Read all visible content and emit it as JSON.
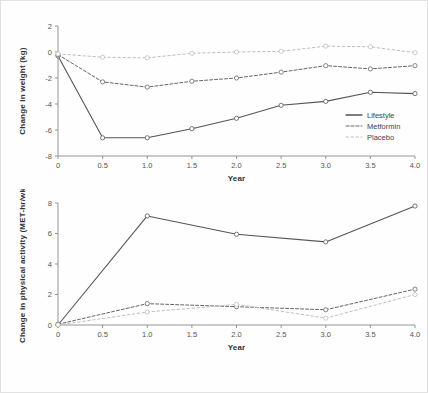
{
  "figure": {
    "background_color": "#fefefe",
    "border_color": "#e2e2e2"
  },
  "series_style": {
    "lifestyle_color": "#555555",
    "metformin_color": "#666666",
    "placebo_color": "#bfbfbf",
    "axis_color": "#8a8a8a",
    "marker_fill": "#ffffff"
  },
  "legend": {
    "position": "inside-bottom-right",
    "entries": [
      {
        "label": "Lifestyle",
        "style": "solid",
        "color": "#555555"
      },
      {
        "label": "Metformin",
        "style": "dashed",
        "color": "#666666"
      },
      {
        "label": "Placebo",
        "style": "dotted",
        "color": "#bfbfbf"
      }
    ]
  },
  "chart_data": [
    {
      "type": "line",
      "id": "weight-change",
      "title": "",
      "xlabel": "Year",
      "ylabel": "Change in weight (kg)",
      "xlim": [
        0,
        4
      ],
      "ylim": [
        -8,
        2
      ],
      "xticks": [
        "0",
        "0.5",
        "1.0",
        "1.5",
        "2.0",
        "2.5",
        "3.0",
        "3.5",
        "4.0"
      ],
      "yticks": [
        "2",
        "0",
        "-2",
        "-4",
        "-6",
        "-8"
      ],
      "grid": false,
      "legend_position": "bottom-right-inside",
      "x": [
        0,
        0.5,
        1.0,
        1.5,
        2.0,
        2.5,
        3.0,
        3.5,
        4.0
      ],
      "series": [
        {
          "name": "Lifestyle",
          "values": [
            -0.3,
            -6.6,
            -6.6,
            -5.9,
            -5.1,
            -4.1,
            -3.8,
            -3.1,
            -3.2
          ]
        },
        {
          "name": "Metformin",
          "values": [
            -0.2,
            -2.3,
            -2.7,
            -2.25,
            -2.0,
            -1.55,
            -1.05,
            -1.3,
            -1.05
          ]
        },
        {
          "name": "Placebo",
          "values": [
            -0.15,
            -0.4,
            -0.45,
            -0.1,
            0.0,
            0.05,
            0.45,
            0.4,
            -0.05
          ]
        }
      ]
    },
    {
      "type": "line",
      "id": "physical-activity-change",
      "title": "",
      "xlabel": "Year",
      "ylabel": "Change in physical activity (MET-hr/wk)",
      "xlim": [
        0,
        4
      ],
      "ylim": [
        0,
        8
      ],
      "xticks": [
        "0",
        "0.5",
        "1.0",
        "1.5",
        "2.0",
        "2.5",
        "3.0",
        "3.5",
        "4.0"
      ],
      "yticks": [
        "8",
        "6",
        "4",
        "2",
        "0"
      ],
      "grid": false,
      "legend_position": "none",
      "x": [
        0,
        1.0,
        2.0,
        3.0,
        4.0
      ],
      "series": [
        {
          "name": "Lifestyle",
          "values": [
            0.0,
            7.15,
            5.95,
            5.45,
            7.8
          ]
        },
        {
          "name": "Metformin",
          "values": [
            0.05,
            1.4,
            1.2,
            1.0,
            2.35
          ]
        },
        {
          "name": "Placebo",
          "values": [
            0.0,
            0.85,
            1.35,
            0.45,
            2.0
          ]
        }
      ]
    }
  ]
}
